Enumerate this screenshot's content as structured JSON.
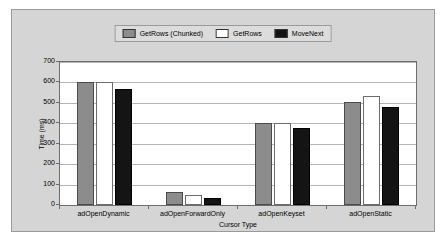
{
  "chart_data": {
    "type": "bar",
    "title": "",
    "xlabel": "Cursor Type",
    "ylabel": "Time (ms)",
    "categories": [
      "adOpenDynamic",
      "adOpenForwardOnly",
      "adOpenKeyset",
      "adOpenStatic"
    ],
    "series": [
      {
        "name": "GetRows (Chunked)",
        "color": "#8c8c8c",
        "values": [
          600,
          65,
          400,
          505
        ]
      },
      {
        "name": "GetRows",
        "color": "#ffffff",
        "values": [
          600,
          50,
          400,
          535
        ]
      },
      {
        "name": "MoveNext",
        "color": "#141414",
        "values": [
          570,
          35,
          375,
          478
        ]
      }
    ],
    "ylim": [
      0,
      700
    ],
    "ytick_step": 100,
    "yticks": [
      "700",
      "600",
      "500",
      "400",
      "300",
      "200",
      "100",
      "0"
    ],
    "grid": true,
    "legend_position": "top-center"
  },
  "colors": {
    "panel_background": "#d5d5d5",
    "plot_background": "#ffffff",
    "axis": "#6d6d6d",
    "gridline": "#b4b4b4",
    "legend_background": "#dcdcdc",
    "text": "#000000"
  }
}
